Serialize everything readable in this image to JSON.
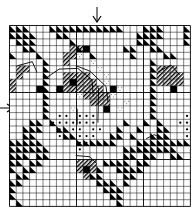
{
  "chart": {
    "type": "needlework-pattern-grid",
    "cols": 27,
    "rows": 27,
    "cell_px": 6.7,
    "center_col": 13,
    "center_row": 12,
    "colors": {
      "grid_line": "#000000",
      "background": "#ffffff",
      "fill": "#000000"
    },
    "legend_symbols": [
      "half-triangle",
      "diagonal-hatch",
      "dot",
      "solid-square",
      "backstitch-line",
      "speckle"
    ],
    "triangles": [
      [
        0,
        0
      ],
      [
        1,
        0
      ],
      [
        2,
        0
      ],
      [
        6,
        0
      ],
      [
        7,
        0
      ],
      [
        8,
        0
      ],
      [
        9,
        0
      ],
      [
        10,
        0
      ],
      [
        11,
        0
      ],
      [
        12,
        0
      ],
      [
        13,
        0
      ],
      [
        14,
        0
      ],
      [
        15,
        0
      ],
      [
        16,
        0
      ],
      [
        20,
        0
      ],
      [
        21,
        0
      ],
      [
        22,
        0
      ],
      [
        26,
        0
      ],
      [
        0,
        1
      ],
      [
        1,
        1
      ],
      [
        2,
        1
      ],
      [
        3,
        1
      ],
      [
        7,
        1
      ],
      [
        8,
        1
      ],
      [
        19,
        1
      ],
      [
        20,
        1
      ],
      [
        21,
        1
      ],
      [
        22,
        1
      ],
      [
        26,
        1
      ],
      [
        1,
        2
      ],
      [
        2,
        2
      ],
      [
        3,
        2
      ],
      [
        9,
        2
      ],
      [
        19,
        2
      ],
      [
        20,
        2
      ],
      [
        21,
        2
      ],
      [
        26,
        2
      ],
      [
        2,
        3
      ],
      [
        3,
        3
      ],
      [
        10,
        3
      ],
      [
        11,
        3
      ],
      [
        17,
        3
      ],
      [
        18,
        3
      ],
      [
        21,
        3
      ],
      [
        22,
        3
      ],
      [
        0,
        4
      ],
      [
        4,
        4
      ],
      [
        12,
        4
      ],
      [
        18,
        4
      ],
      [
        23,
        4
      ],
      [
        24,
        4
      ],
      [
        5,
        5
      ],
      [
        5,
        6
      ],
      [
        5,
        7
      ],
      [
        5,
        8
      ],
      [
        5,
        9
      ],
      [
        5,
        10
      ],
      [
        5,
        11
      ],
      [
        5,
        12
      ],
      [
        5,
        13
      ],
      [
        21,
        5
      ],
      [
        21,
        6
      ],
      [
        21,
        7
      ],
      [
        21,
        8
      ],
      [
        21,
        9
      ],
      [
        21,
        10
      ],
      [
        21,
        11
      ],
      [
        21,
        12
      ],
      [
        21,
        13
      ],
      [
        3,
        14
      ],
      [
        4,
        14
      ],
      [
        6,
        14
      ],
      [
        17,
        14
      ],
      [
        20,
        14
      ],
      [
        22,
        14
      ],
      [
        2,
        15
      ],
      [
        3,
        15
      ],
      [
        4,
        15
      ],
      [
        7,
        15
      ],
      [
        8,
        15
      ],
      [
        16,
        15
      ],
      [
        19,
        15
      ],
      [
        22,
        15
      ],
      [
        23,
        15
      ],
      [
        2,
        16
      ],
      [
        3,
        16
      ],
      [
        8,
        16
      ],
      [
        9,
        16
      ],
      [
        15,
        16
      ],
      [
        16,
        16
      ],
      [
        18,
        16
      ],
      [
        21,
        16
      ],
      [
        22,
        16
      ],
      [
        23,
        16
      ],
      [
        0,
        17
      ],
      [
        1,
        17
      ],
      [
        2,
        17
      ],
      [
        3,
        17
      ],
      [
        4,
        17
      ],
      [
        10,
        17
      ],
      [
        11,
        17
      ],
      [
        12,
        17
      ],
      [
        13,
        17
      ],
      [
        14,
        17
      ],
      [
        15,
        17
      ],
      [
        19,
        17
      ],
      [
        20,
        17
      ],
      [
        21,
        17
      ],
      [
        22,
        17
      ],
      [
        23,
        17
      ],
      [
        24,
        17
      ],
      [
        25,
        17
      ],
      [
        26,
        17
      ],
      [
        0,
        18
      ],
      [
        1,
        18
      ],
      [
        2,
        18
      ],
      [
        3,
        18
      ],
      [
        4,
        18
      ],
      [
        5,
        18
      ],
      [
        17,
        18
      ],
      [
        18,
        18
      ],
      [
        19,
        18
      ],
      [
        20,
        18
      ],
      [
        21,
        18
      ],
      [
        22,
        18
      ],
      [
        23,
        18
      ],
      [
        24,
        18
      ],
      [
        0,
        19
      ],
      [
        1,
        19
      ],
      [
        2,
        19
      ],
      [
        4,
        19
      ],
      [
        5,
        19
      ],
      [
        17,
        19
      ],
      [
        18,
        19
      ],
      [
        20,
        19
      ],
      [
        21,
        19
      ],
      [
        24,
        19
      ],
      [
        25,
        19
      ],
      [
        0,
        20
      ],
      [
        1,
        20
      ],
      [
        3,
        20
      ],
      [
        4,
        20
      ],
      [
        14,
        20
      ],
      [
        15,
        20
      ],
      [
        16,
        20
      ],
      [
        17,
        20
      ],
      [
        19,
        20
      ],
      [
        20,
        20
      ],
      [
        0,
        21
      ],
      [
        2,
        21
      ],
      [
        3,
        21
      ],
      [
        13,
        21
      ],
      [
        16,
        21
      ],
      [
        17,
        21
      ],
      [
        18,
        21
      ],
      [
        19,
        21
      ],
      [
        1,
        22
      ],
      [
        2,
        22
      ],
      [
        12,
        22
      ],
      [
        13,
        22
      ],
      [
        17,
        22
      ],
      [
        18,
        22
      ],
      [
        0,
        23
      ],
      [
        1,
        23
      ],
      [
        13,
        23
      ],
      [
        14,
        23
      ],
      [
        15,
        23
      ],
      [
        17,
        23
      ],
      [
        0,
        24
      ],
      [
        14,
        24
      ],
      [
        15,
        24
      ],
      [
        16,
        24
      ],
      [
        0,
        25
      ],
      [
        15,
        25
      ],
      [
        16,
        25
      ],
      [
        1,
        26
      ],
      [
        16,
        26
      ]
    ],
    "hatch": [
      [
        9,
        3
      ],
      [
        10,
        3
      ],
      [
        9,
        4
      ],
      [
        8,
        4
      ],
      [
        8,
        5
      ],
      [
        1,
        6
      ],
      [
        2,
        6
      ],
      [
        1,
        7
      ],
      [
        0,
        8
      ],
      [
        0,
        9
      ],
      [
        8,
        7
      ],
      [
        9,
        7
      ],
      [
        10,
        7
      ],
      [
        11,
        7
      ],
      [
        8,
        8
      ],
      [
        9,
        8
      ],
      [
        10,
        8
      ],
      [
        11,
        8
      ],
      [
        12,
        8
      ],
      [
        7,
        9
      ],
      [
        8,
        9
      ],
      [
        9,
        9
      ],
      [
        10,
        9
      ],
      [
        11,
        9
      ],
      [
        12,
        9
      ],
      [
        13,
        9
      ],
      [
        11,
        10
      ],
      [
        12,
        10
      ],
      [
        13,
        10
      ],
      [
        14,
        10
      ],
      [
        12,
        11
      ],
      [
        13,
        11
      ],
      [
        14,
        11
      ],
      [
        22,
        6
      ],
      [
        23,
        6
      ],
      [
        24,
        6
      ],
      [
        22,
        7
      ],
      [
        23,
        7
      ],
      [
        24,
        7
      ],
      [
        25,
        7
      ],
      [
        22,
        8
      ],
      [
        23,
        8
      ],
      [
        24,
        8
      ],
      [
        25,
        8
      ],
      [
        10,
        20
      ],
      [
        11,
        20
      ],
      [
        12,
        20
      ],
      [
        10,
        21
      ],
      [
        11,
        21
      ],
      [
        12,
        21
      ],
      [
        11,
        22
      ]
    ],
    "solid": [
      [
        11,
        3
      ],
      [
        15,
        9
      ],
      [
        14,
        12
      ],
      [
        9,
        8
      ],
      [
        4,
        9
      ],
      [
        11,
        21
      ],
      [
        24,
        9
      ],
      [
        7,
        9
      ]
    ],
    "dots": [
      [
        7,
        13
      ],
      [
        8,
        13
      ],
      [
        10,
        13
      ],
      [
        11,
        13
      ],
      [
        12,
        13
      ],
      [
        6,
        14
      ],
      [
        7,
        14
      ],
      [
        8,
        14
      ],
      [
        9,
        14
      ],
      [
        10,
        14
      ],
      [
        11,
        14
      ],
      [
        12,
        14
      ],
      [
        7,
        15
      ],
      [
        9,
        15
      ],
      [
        10,
        15
      ],
      [
        12,
        15
      ],
      [
        13,
        15
      ],
      [
        7,
        16
      ],
      [
        10,
        16
      ],
      [
        11,
        16
      ],
      [
        12,
        16
      ],
      [
        10,
        17
      ],
      [
        11,
        17
      ],
      [
        10,
        18
      ],
      [
        26,
        13
      ],
      [
        25,
        14
      ],
      [
        26,
        14
      ],
      [
        26,
        15
      ],
      [
        26,
        16
      ]
    ],
    "speckle": [
      [
        10,
        4
      ],
      [
        13,
        6
      ],
      [
        14,
        7
      ],
      [
        14,
        8
      ],
      [
        15,
        10
      ],
      [
        12,
        5
      ],
      [
        10,
        10
      ],
      [
        9,
        12
      ],
      [
        16,
        9
      ],
      [
        16,
        12
      ],
      [
        17,
        11
      ]
    ],
    "backstitch": [
      "M 5.5 7.8 L 7.4 6.5 L 10.2 6.4 L 12.3 8.1 L 12.5 10.6",
      "M 9.9 6.0 L 12.0 6.8 L 14.4 9.1 L 14.7 11.4",
      "M 13.3 9.3 L 13.2 14.5",
      "M 22.2 6.9 L 24.1 5.9 L 25.4 7.4",
      "M 9.9 19.4 L 12.0 19.6 L 13.0 20.6",
      "M 20.4 16.9 L 21.6 16.3 L 22.9 16.9",
      "M 10.1 12.4 L 10.1 14.8",
      "M 1.2 6.0 L 3.4 5.4 L 4.1 7.0"
    ],
    "markers": {
      "top_arrow": {
        "col": 13,
        "label": "center"
      },
      "left_arrow": {
        "row": 12,
        "label": "center"
      }
    }
  }
}
